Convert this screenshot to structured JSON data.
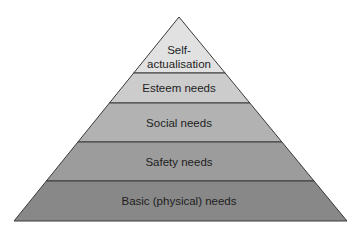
{
  "diagram": {
    "type": "pyramid",
    "title": "",
    "apex": [
      179,
      17
    ],
    "base_y": 221,
    "base_left": 14,
    "base_right": 347,
    "layers": [
      {
        "label_lines": [
          "Self-",
          "actualisation"
        ],
        "top_y": 17,
        "bottom_y": 73,
        "fill": "#e1e1e1"
      },
      {
        "label_lines": [
          "Esteem needs"
        ],
        "top_y": 73,
        "bottom_y": 103,
        "fill": "#cccccc"
      },
      {
        "label_lines": [
          "Social needs"
        ],
        "top_y": 103,
        "bottom_y": 142,
        "fill": "#b2b2b2"
      },
      {
        "label_lines": [
          "Safety needs"
        ],
        "top_y": 142,
        "bottom_y": 181,
        "fill": "#9c9c9c"
      },
      {
        "label_lines": [
          "Basic (physical) needs"
        ],
        "top_y": 181,
        "bottom_y": 221,
        "fill": "#888888"
      }
    ],
    "line_color": "#3a3a3a"
  }
}
